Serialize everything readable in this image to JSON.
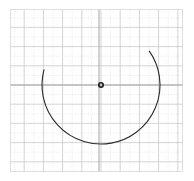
{
  "figure": {
    "width": 194,
    "height": 181,
    "background": "#ffffff"
  },
  "chart_data": {
    "type": "scatter",
    "title": "",
    "subtitle": "",
    "xlabel": "",
    "ylabel": "",
    "grid": true,
    "grid_major": true,
    "grid_minor": true,
    "legend": false,
    "legend_position": "none",
    "axis_lines": true,
    "xlim": [
      -4.5,
      4.5
    ],
    "ylim": [
      -4.5,
      4.5
    ],
    "xticks": [
      -4,
      -3,
      -2,
      -1,
      0,
      1,
      2,
      3,
      4
    ],
    "yticks": [
      -4,
      -3,
      -2,
      -1,
      0,
      1,
      2,
      3,
      4
    ],
    "xticklabels": [
      "",
      "",
      "",
      "",
      "",
      "",
      "",
      "",
      ""
    ],
    "yticklabels": [
      "",
      "",
      "",
      "",
      "",
      "",
      "",
      "",
      ""
    ],
    "minor_divisions": 2,
    "series": [
      {
        "name": "center-point",
        "type": "scatter",
        "marker": "circle-open",
        "color": "#1a1a1a",
        "points": [
          {
            "x": 0.0,
            "y": 0.0
          }
        ]
      },
      {
        "name": "open-arc",
        "type": "arc",
        "color": "#2b2b2b",
        "linewidth": 1.1,
        "center": {
          "x": 0.0,
          "y": 0.0
        },
        "radius": 2.8,
        "start_angle_deg": 35,
        "end_angle_deg": 165,
        "direction": "clockwise-through-bottom",
        "sweep_deg": 230,
        "closed": false
      }
    ],
    "annotations": []
  },
  "style": {
    "major_grid_color": "#c9c9c9",
    "minor_grid_color": "#e2e2e2",
    "axis_color": "#9a9a9a",
    "border_color": "#d8d8d8",
    "curve_color": "#2b2b2b",
    "point_color": "#1a1a1a"
  },
  "geometry_px": {
    "plot_left": 10,
    "plot_top": 9,
    "plot_right": 183,
    "plot_bottom": 172,
    "center_x": 101,
    "center_y": 85,
    "radius": 59,
    "major_step": 19.2
  }
}
